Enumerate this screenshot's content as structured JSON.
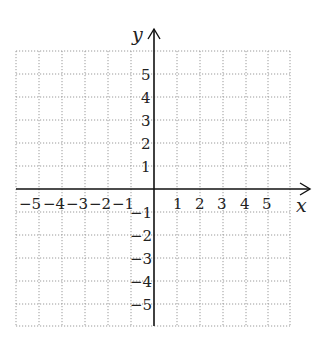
{
  "diagram": {
    "type": "coordinate-grid",
    "x_axis": {
      "label": "x",
      "min": -6,
      "max": 6,
      "tick_labels": [
        "−5",
        "−4",
        "−3",
        "−2",
        "−1",
        "1",
        "2",
        "3",
        "4",
        "5"
      ]
    },
    "y_axis": {
      "label": "y",
      "min": -6,
      "max": 6,
      "tick_labels": [
        "5",
        "4",
        "3",
        "2",
        "1",
        "−1",
        "−2",
        "−3",
        "−4",
        "−5"
      ]
    },
    "grid": {
      "style": "dotted",
      "cols": 12,
      "rows": 12
    },
    "colors": {
      "axis": "#111111",
      "grid": "#9a9a9a",
      "text": "#222222"
    }
  },
  "labels": {
    "x_axis": "x",
    "y_axis": "y",
    "x_ticks": {
      "n5": "−5",
      "n4": "−4",
      "n3": "−3",
      "n2": "−2",
      "n1": "−1",
      "p1": "1",
      "p2": "2",
      "p3": "3",
      "p4": "4",
      "p5": "5"
    },
    "y_ticks": {
      "p5": "5",
      "p4": "4",
      "p3": "3",
      "p2": "2",
      "p1": "1",
      "n1": "−1",
      "n2": "−2",
      "n3": "−3",
      "n4": "−4",
      "n5": "−5"
    }
  }
}
